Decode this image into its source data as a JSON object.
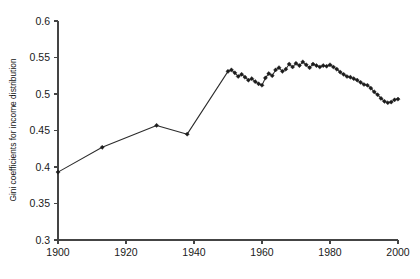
{
  "chart_data": {
    "type": "line",
    "title": "",
    "subtitle": "",
    "xlabel": "",
    "ylabel": "Gini coefficients for income distribution",
    "xlim": [
      1900,
      2000
    ],
    "ylim": [
      0.3,
      0.6
    ],
    "xticks": [
      1900,
      1920,
      1940,
      1960,
      1980,
      2000
    ],
    "xticklabels": [
      "1900",
      "1920",
      "1940",
      "1960",
      "1980",
      "2000"
    ],
    "yticks": [
      0.3,
      0.35,
      0.4,
      0.45,
      0.5,
      0.55,
      0.6
    ],
    "yticklabels": [
      "0.3",
      "0.35",
      "0.4",
      "0.45",
      "0.5",
      "0.55",
      "0.6"
    ],
    "grid": false,
    "legend": false,
    "legend_position": "none",
    "markers": "diamond",
    "line_color": "#2b2b2b",
    "marker_color": "#1c1c1c",
    "background_color": "#ffffff",
    "axis_color": "#444444",
    "series": [
      {
        "name": "Gini coefficient",
        "x": [
          1900,
          1913,
          1929,
          1938,
          1950,
          1951,
          1952,
          1953,
          1954,
          1955,
          1956,
          1957,
          1958,
          1959,
          1960,
          1961,
          1962,
          1963,
          1964,
          1965,
          1966,
          1967,
          1968,
          1969,
          1970,
          1971,
          1972,
          1973,
          1974,
          1975,
          1976,
          1977,
          1978,
          1979,
          1980,
          1981,
          1982,
          1983,
          1984,
          1985,
          1986,
          1987,
          1988,
          1989,
          1990,
          1991,
          1992,
          1993,
          1994,
          1995,
          1996,
          1997,
          1998,
          1999,
          2000
        ],
        "values": [
          0.393,
          0.427,
          0.457,
          0.445,
          0.531,
          0.533,
          0.529,
          0.524,
          0.527,
          0.523,
          0.519,
          0.521,
          0.517,
          0.514,
          0.512,
          0.522,
          0.528,
          0.525,
          0.533,
          0.536,
          0.531,
          0.534,
          0.541,
          0.537,
          0.542,
          0.539,
          0.544,
          0.54,
          0.536,
          0.541,
          0.539,
          0.537,
          0.539,
          0.538,
          0.54,
          0.537,
          0.534,
          0.53,
          0.527,
          0.524,
          0.523,
          0.521,
          0.519,
          0.516,
          0.513,
          0.512,
          0.508,
          0.503,
          0.499,
          0.494,
          0.49,
          0.488,
          0.489,
          0.492,
          0.493
        ]
      }
    ]
  },
  "layout": {
    "plot_left": 58,
    "plot_right": 398,
    "plot_top": 21,
    "plot_bottom": 240
  }
}
